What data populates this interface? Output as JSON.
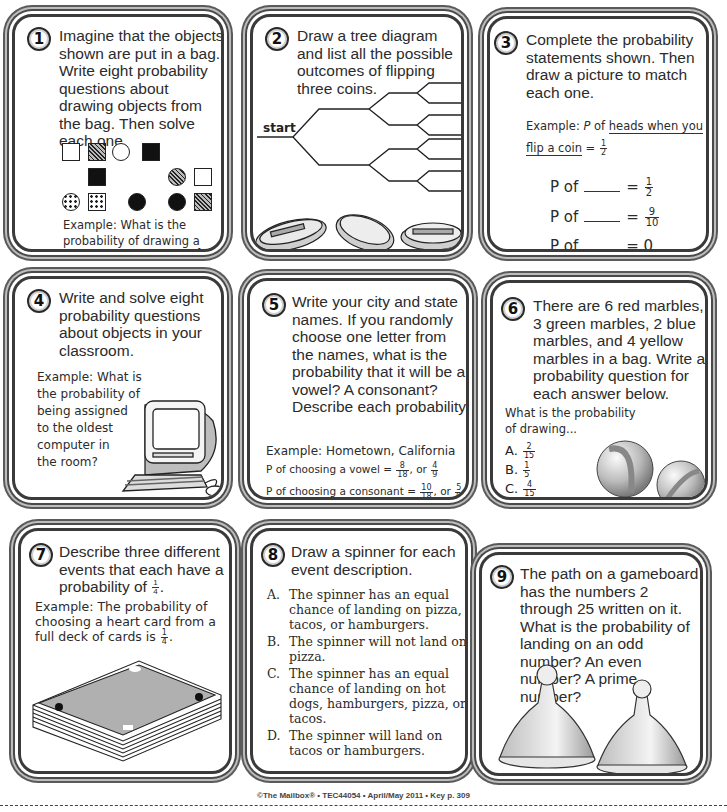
{
  "cards": [
    {
      "number": "1",
      "prompt": "Imagine that the objects shown are put in a bag. Write eight probability questions about drawing objects from the bag. Then solve each one.",
      "example_text": "Example: What is the probability of drawing a round, striped object?",
      "example_answer": {
        "num": "1",
        "den": "12"
      },
      "shapes": [
        {
          "type": "square",
          "fill": "empty"
        },
        {
          "type": "square",
          "fill": "striped"
        },
        {
          "type": "circle",
          "fill": "empty"
        },
        {
          "type": "square",
          "fill": "solid"
        },
        {
          "type": "square",
          "fill": "solid"
        },
        {
          "type": "circle",
          "fill": "striped"
        },
        {
          "type": "square",
          "fill": "empty"
        },
        {
          "type": "circle",
          "fill": "dotted"
        },
        {
          "type": "square",
          "fill": "dotted"
        },
        {
          "type": "circle",
          "fill": "solid"
        },
        {
          "type": "circle",
          "fill": "solid"
        },
        {
          "type": "square",
          "fill": "striped"
        }
      ]
    },
    {
      "number": "2",
      "prompt": "Draw a tree diagram and list all the possible outcomes of flipping three coins.",
      "tree_start_label": "start",
      "illustration": "three-coins"
    },
    {
      "number": "3",
      "prompt": "Complete the probability statements shown. Then draw a picture to match each one.",
      "example_prefix": "Example:",
      "example_p": "P",
      "example_of": "of",
      "example_underlined": "heads when you flip a coin",
      "example_eq": "=",
      "example_answer": {
        "num": "1",
        "den": "2"
      },
      "statements": [
        {
          "p": "P of",
          "eq": "=",
          "answer": {
            "num": "1",
            "den": "2"
          }
        },
        {
          "p": "P of",
          "eq": "=",
          "answer": {
            "num": "9",
            "den": "10"
          }
        },
        {
          "p": "P of",
          "eq": "= 0",
          "answer": null
        }
      ]
    },
    {
      "number": "4",
      "prompt": "Write and solve eight probability questions about objects in your classroom.",
      "example_lines": [
        "Example: What is",
        "the probability of",
        "being assigned",
        "to the oldest",
        "computer in",
        "the room?"
      ],
      "illustration": "computer"
    },
    {
      "number": "5",
      "prompt": "Write your city and state names. If you randomly choose one letter from the names, what is the probability that it will be a vowel? A consonant? Describe each probability.",
      "example_text": "Example: Hometown, California",
      "lines": [
        {
          "text": "P of choosing a vowel =",
          "f1": {
            "num": "8",
            "den": "18"
          },
          "or": ", or",
          "f2": {
            "num": "4",
            "den": "9"
          }
        },
        {
          "text": "P of choosing a consonant =",
          "f1": {
            "num": "10",
            "den": "18"
          },
          "or": ", or",
          "f2": {
            "num": "5",
            "den": "9"
          }
        }
      ]
    },
    {
      "number": "6",
      "prompt": "There are 6 red marbles, 3 green marbles, 2 blue marbles, and 4 yellow marbles in a bag. Write a probability question for each answer below.",
      "question_lines": [
        "What is the probability",
        "of drawing..."
      ],
      "answers": [
        {
          "label": "A.",
          "num": "2",
          "den": "15"
        },
        {
          "label": "B.",
          "num": "1",
          "den": "5"
        },
        {
          "label": "C.",
          "num": "4",
          "den": "15"
        },
        {
          "label": "D.",
          "num": "2",
          "den": "4"
        }
      ],
      "illustration": "two-marbles"
    },
    {
      "number": "7",
      "prompt_before": "Describe three different events that each have a probability of",
      "prompt_frac": {
        "num": "1",
        "den": "4"
      },
      "example_before": "Example: The probability of choosing a heart card from a full deck of cards is",
      "example_frac": {
        "num": "1",
        "den": "4"
      },
      "illustration": "deck-of-cards"
    },
    {
      "number": "8",
      "prompt": "Draw a spinner for each event description.",
      "items": [
        {
          "label": "A.",
          "text": "The spinner has an equal chance of landing on pizza, tacos, or hamburgers."
        },
        {
          "label": "B.",
          "text": "The spinner will not land on pizza."
        },
        {
          "label": "C.",
          "text": "The spinner has an equal chance of landing on hot dogs, hamburgers, pizza, or tacos."
        },
        {
          "label": "D.",
          "text": "The spinner will land on tacos or hamburgers."
        }
      ]
    },
    {
      "number": "9",
      "prompt": "The path on a gameboard has the numbers 2 through 25 written on it. What is the probability of landing on an odd number? An even number? A prime number?",
      "illustration": "two-game-pawns"
    }
  ],
  "footer": "©The Mailbox® • TEC44054 • April/May 2011 • Key p. 309"
}
